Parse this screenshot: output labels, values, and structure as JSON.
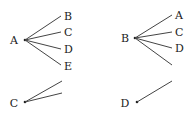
{
  "diagram": {
    "type": "branching-tree",
    "colors": {
      "line": "#444444",
      "text": "#222222",
      "background": "#ffffff"
    },
    "trees": [
      {
        "root": "A",
        "root_pos": [
          14,
          40
        ],
        "hub": [
          25,
          40
        ],
        "branches": [
          {
            "label": "B",
            "end": [
              61,
              16
            ],
            "label_pos": [
              64,
              20
            ]
          },
          {
            "label": "C",
            "end": [
              61,
              32
            ],
            "label_pos": [
              64,
              36
            ]
          },
          {
            "label": "D",
            "end": [
              61,
              49
            ],
            "label_pos": [
              64,
              53
            ]
          },
          {
            "label": "E",
            "end": [
              61,
              65
            ],
            "label_pos": [
              64,
              70
            ]
          }
        ]
      },
      {
        "root": "B",
        "root_pos": [
          125,
          38
        ],
        "hub": [
          135,
          38
        ],
        "branches": [
          {
            "label": "A",
            "end": [
              172,
              15
            ],
            "label_pos": [
              175,
              19
            ]
          },
          {
            "label": "C",
            "end": [
              172,
              32
            ],
            "label_pos": [
              175,
              36
            ]
          },
          {
            "label": "D",
            "end": [
              172,
              48
            ],
            "label_pos": [
              175,
              52
            ]
          },
          {
            "label": "",
            "end": [
              172,
              65
            ],
            "label_pos": [
              175,
              69
            ]
          }
        ]
      },
      {
        "root": "C",
        "root_pos": [
          14,
          103
        ],
        "hub": [
          25,
          102
        ],
        "branches": [
          {
            "label": "",
            "end": [
              62,
              81
            ],
            "label_pos": [
              65,
              85
            ]
          },
          {
            "label": "",
            "end": [
              62,
              93
            ],
            "label_pos": [
              65,
              97
            ]
          }
        ]
      },
      {
        "root": "D",
        "root_pos": [
          125,
          103
        ],
        "hub": [
          137,
          102
        ],
        "branches": [
          {
            "label": "",
            "end": [
              172,
              81
            ],
            "label_pos": [
              175,
              85
            ]
          }
        ]
      }
    ]
  }
}
